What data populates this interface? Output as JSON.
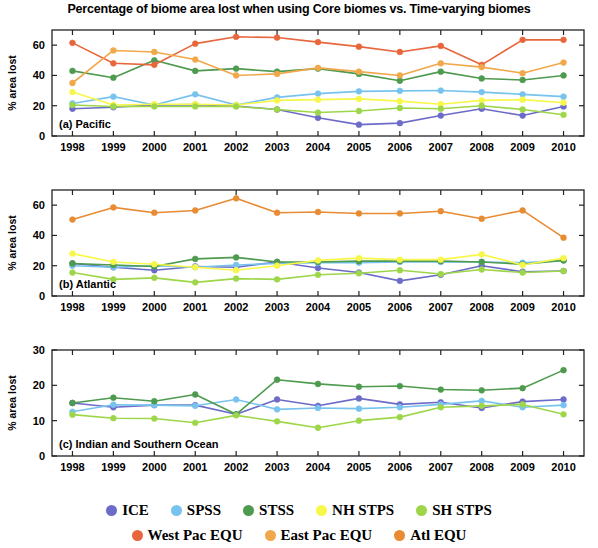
{
  "figure": {
    "title": "Percentage of biome area lost when using Core biomes vs. Time-varying biomes",
    "ylabel": "% area lost"
  },
  "legend": {
    "position": "bottom",
    "rows": [
      [
        {
          "label": "ICE",
          "color": "#6c6cc8"
        },
        {
          "label": "SPSS",
          "color": "#77c3ee"
        },
        {
          "label": "STSS",
          "color": "#4e9a4e"
        },
        {
          "label": "NH STPS",
          "color": "#f7f74a"
        },
        {
          "label": "SH STPS",
          "color": "#9ed64a"
        }
      ],
      [
        {
          "label": "West Pac EQU",
          "color": "#e8663c"
        },
        {
          "label": "East Pac EQU",
          "color": "#f0a84a"
        },
        {
          "label": "Atl EQU",
          "color": "#e88b32"
        }
      ]
    ]
  },
  "chart_data": [
    {
      "type": "line",
      "panel": "a",
      "title": "(a) Pacific",
      "xlabel": "",
      "ylabel": "% area lost",
      "x": [
        1998,
        1999,
        2000,
        2001,
        2002,
        2003,
        2004,
        2005,
        2006,
        2007,
        2008,
        2009,
        2010
      ],
      "categories": [
        "1998",
        "1999",
        "2000",
        "2001",
        "2002",
        "2003",
        "2004",
        "2005",
        "2006",
        "2007",
        "2008",
        "2009",
        "2010"
      ],
      "xlim": [
        1997.5,
        2010.5
      ],
      "ylim": [
        0,
        70
      ],
      "yticks": [
        0,
        20,
        40,
        60
      ],
      "grid": false,
      "series": [
        {
          "name": "ICE",
          "color": "#6c6cc8",
          "values": [
            18.0,
            19.0,
            20.5,
            20.7,
            19.8,
            17.5,
            12.0,
            7.5,
            8.5,
            13.5,
            18.0,
            13.5,
            19.5
          ]
        },
        {
          "name": "SPSS",
          "color": "#77c3ee",
          "values": [
            21.5,
            26.0,
            20.5,
            27.5,
            20.5,
            25.5,
            28.0,
            29.5,
            29.8,
            30.0,
            29.0,
            27.5,
            26.0
          ]
        },
        {
          "name": "STSS",
          "color": "#4e9a4e",
          "values": [
            43.0,
            38.5,
            50.0,
            43.0,
            44.5,
            42.5,
            44.5,
            41.0,
            36.5,
            42.5,
            38.0,
            37.0,
            40.0
          ]
        },
        {
          "name": "NH STPS",
          "color": "#f7f74a",
          "values": [
            29.0,
            20.5,
            21.0,
            21.0,
            20.5,
            23.5,
            24.0,
            24.5,
            23.0,
            21.0,
            23.5,
            24.0,
            22.0
          ]
        },
        {
          "name": "SH STPS",
          "color": "#9ed64a",
          "values": [
            20.5,
            19.5,
            19.5,
            19.5,
            19.5,
            17.5,
            15.5,
            16.5,
            18.5,
            18.0,
            20.0,
            17.5,
            14.0
          ]
        },
        {
          "name": "West Pac EQU",
          "color": "#e8663c",
          "values": [
            61.5,
            48.0,
            47.0,
            61.0,
            65.5,
            65.0,
            62.0,
            59.0,
            55.5,
            59.5,
            47.0,
            63.5,
            63.5
          ]
        },
        {
          "name": "East Pac EQU",
          "color": "#f0a84a",
          "values": [
            35.0,
            56.5,
            55.5,
            50.5,
            40.0,
            41.0,
            45.0,
            42.5,
            40.0,
            48.0,
            45.5,
            41.5,
            48.5
          ]
        }
      ]
    },
    {
      "type": "line",
      "panel": "b",
      "title": "(b) Atlantic",
      "xlabel": "",
      "ylabel": "% area lost",
      "x": [
        1998,
        1999,
        2000,
        2001,
        2002,
        2003,
        2004,
        2005,
        2006,
        2007,
        2008,
        2009,
        2010
      ],
      "categories": [
        "1998",
        "1999",
        "2000",
        "2001",
        "2002",
        "2003",
        "2004",
        "2005",
        "2006",
        "2007",
        "2008",
        "2009",
        "2010"
      ],
      "xlim": [
        1997.5,
        2010.5
      ],
      "ylim": [
        0,
        70
      ],
      "yticks": [
        0,
        20,
        40,
        60
      ],
      "grid": false,
      "series": [
        {
          "name": "ICE",
          "color": "#6c6cc8",
          "values": [
            21.5,
            19.0,
            17.0,
            19.5,
            19.0,
            22.5,
            18.5,
            15.5,
            10.0,
            14.0,
            20.0,
            16.0,
            16.5
          ]
        },
        {
          "name": "SPSS",
          "color": "#77c3ee",
          "values": [
            20.0,
            19.0,
            20.0,
            19.0,
            20.5,
            21.5,
            22.0,
            22.0,
            22.5,
            22.5,
            22.5,
            22.0,
            23.5
          ]
        },
        {
          "name": "STSS",
          "color": "#4e9a4e",
          "values": [
            21.5,
            20.5,
            19.5,
            24.5,
            25.5,
            22.5,
            22.5,
            23.0,
            23.0,
            23.0,
            22.5,
            21.0,
            23.5
          ]
        },
        {
          "name": "NH STPS",
          "color": "#f7f74a",
          "values": [
            28.0,
            22.5,
            21.0,
            19.0,
            17.0,
            20.0,
            23.5,
            25.0,
            24.0,
            24.0,
            27.5,
            20.5,
            25.0
          ]
        },
        {
          "name": "SH STPS",
          "color": "#9ed64a",
          "values": [
            15.5,
            11.0,
            12.0,
            9.0,
            11.5,
            11.0,
            14.0,
            15.0,
            17.0,
            14.5,
            17.5,
            15.5,
            16.5
          ]
        },
        {
          "name": "Atl EQU",
          "color": "#e88b32",
          "values": [
            50.5,
            58.5,
            55.0,
            56.5,
            64.5,
            55.0,
            55.5,
            54.5,
            54.5,
            56.0,
            51.0,
            56.5,
            38.5
          ]
        }
      ]
    },
    {
      "type": "line",
      "panel": "c",
      "title": "(c) Indian and Southern Ocean",
      "xlabel": "",
      "ylabel": "% area lost",
      "x": [
        1998,
        1999,
        2000,
        2001,
        2002,
        2003,
        2004,
        2005,
        2006,
        2007,
        2008,
        2009,
        2010
      ],
      "categories": [
        "1998",
        "1999",
        "2000",
        "2001",
        "2002",
        "2003",
        "2004",
        "2005",
        "2006",
        "2007",
        "2008",
        "2009",
        "2010"
      ],
      "xlim": [
        1997.5,
        2010.5
      ],
      "ylim": [
        0,
        30
      ],
      "yticks": [
        0,
        10,
        20,
        30
      ],
      "grid": false,
      "series": [
        {
          "name": "ICE",
          "color": "#6c6cc8",
          "values": [
            15.0,
            13.8,
            14.4,
            14.4,
            11.8,
            16.0,
            14.2,
            16.3,
            14.6,
            15.2,
            13.6,
            15.4,
            16.0
          ]
        },
        {
          "name": "SPSS",
          "color": "#77c3ee",
          "values": [
            12.5,
            14.5,
            14.4,
            14.2,
            16.0,
            13.2,
            13.6,
            13.4,
            13.8,
            14.6,
            15.6,
            13.8,
            14.4
          ]
        },
        {
          "name": "STSS",
          "color": "#4e9a4e",
          "values": [
            15.0,
            16.5,
            15.5,
            17.4,
            11.8,
            21.6,
            20.4,
            19.6,
            19.8,
            18.8,
            18.6,
            19.2,
            24.3
          ]
        },
        {
          "name": "SH STPS",
          "color": "#9ed64a",
          "values": [
            11.7,
            10.7,
            10.6,
            9.4,
            11.5,
            9.8,
            8.0,
            10.0,
            11.0,
            13.8,
            14.2,
            14.6,
            11.8
          ]
        }
      ]
    }
  ]
}
